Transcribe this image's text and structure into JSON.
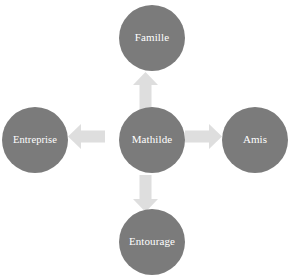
{
  "diagram": {
    "type": "radial-relationship-map",
    "background_color": "#ffffff",
    "node_color": "#7b7b7b",
    "node_text_color": "#ffffff",
    "arrow_color": "#dedede",
    "center": {
      "id": "mathilde",
      "label": "Mathilde"
    },
    "nodes": [
      {
        "id": "famille",
        "label": "Famille",
        "position": "top"
      },
      {
        "id": "entreprise",
        "label": "Entreprise",
        "position": "left"
      },
      {
        "id": "mathilde",
        "label": "Mathilde",
        "position": "center"
      },
      {
        "id": "amis",
        "label": "Amis",
        "position": "right"
      },
      {
        "id": "entourage",
        "label": "Entourage",
        "position": "bottom"
      }
    ],
    "arrows": [
      {
        "id": "arrow-up",
        "from": "mathilde",
        "to": "famille",
        "direction": "up"
      },
      {
        "id": "arrow-left",
        "from": "mathilde",
        "to": "entreprise",
        "direction": "left"
      },
      {
        "id": "arrow-right",
        "from": "mathilde",
        "to": "amis",
        "direction": "right"
      },
      {
        "id": "arrow-down",
        "from": "mathilde",
        "to": "entourage",
        "direction": "down"
      }
    ]
  }
}
